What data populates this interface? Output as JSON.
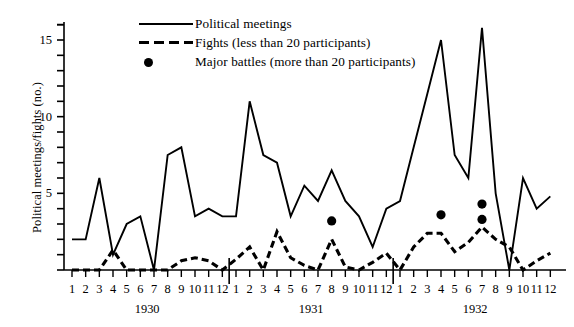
{
  "chart_data": {
    "type": "line",
    "title": "",
    "xlabel": "",
    "ylabel": "Political meetings/fights (no.)",
    "ylim": [
      0,
      16.6
    ],
    "yticks": [
      0,
      1,
      2,
      3,
      4,
      5,
      6,
      7,
      8,
      9,
      10,
      11,
      12,
      13,
      14,
      15,
      16
    ],
    "ytick_labels": [
      {
        "value": 5,
        "label": "5"
      },
      {
        "value": 10,
        "label": "10"
      },
      {
        "value": 15,
        "label": "15"
      }
    ],
    "grid": false,
    "legend_position": "top-center",
    "x_group_labels": [
      "1930",
      "1931",
      "1932"
    ],
    "categories": [
      "1930-1",
      "1930-2",
      "1930-3",
      "1930-4",
      "1930-5",
      "1930-6",
      "1930-7",
      "1930-8",
      "1930-9",
      "1930-10",
      "1930-11",
      "1930-12",
      "1931-1",
      "1931-2",
      "1931-3",
      "1931-4",
      "1931-5",
      "1931-6",
      "1931-7",
      "1931-8",
      "1931-9",
      "1931-10",
      "1931-11",
      "1931-12",
      "1932-1",
      "1932-2",
      "1932-3",
      "1932-4",
      "1932-5",
      "1932-6",
      "1932-7",
      "1932-8",
      "1932-9",
      "1932-10",
      "1932-11",
      "1932-12"
    ],
    "xtick_labels": [
      "1",
      "2",
      "3",
      "4",
      "5",
      "6",
      "7",
      "8",
      "9",
      "10",
      "11",
      "12",
      "1",
      "2",
      "3",
      "4",
      "5",
      "6",
      "7",
      "8",
      "9",
      "10",
      "11",
      "12",
      "1",
      "2",
      "3",
      "4",
      "5",
      "6",
      "7",
      "8",
      "9",
      "10",
      "11",
      "12"
    ],
    "series": [
      {
        "name": "Political meetings",
        "style": "solid",
        "color": "#000000",
        "values": [
          2,
          2,
          6,
          1,
          3,
          3.5,
          0,
          7.5,
          8,
          3.5,
          4,
          3.5,
          3.5,
          11,
          7.5,
          7,
          3.5,
          5.5,
          4.5,
          6.5,
          4.5,
          3.5,
          1.5,
          4,
          4.5,
          8,
          11.5,
          15,
          7.5,
          6,
          15.8,
          5,
          0,
          6,
          4,
          4.8
        ]
      },
      {
        "name": "Fights (less than 20 participants)",
        "style": "dashed",
        "color": "#000000",
        "values": [
          0,
          0,
          0,
          1.3,
          0,
          0,
          0,
          0,
          0.6,
          0.8,
          0.6,
          0,
          0.7,
          1.5,
          0,
          2.5,
          0.8,
          0.3,
          0,
          2,
          0.2,
          0,
          0.5,
          1.1,
          0,
          1.5,
          2.4,
          2.4,
          1.2,
          1.8,
          2.8,
          2,
          1.5,
          0,
          0.6,
          1.1
        ]
      }
    ],
    "markers": [
      {
        "name": "Major battles (more than 20 participants)",
        "x": "1931-8",
        "y": 3.2
      },
      {
        "name": "Major battles (more than 20 participants)",
        "x": "1932-4",
        "y": 3.6
      },
      {
        "name": "Major battles (more than 20 participants)",
        "x": "1932-7",
        "y": 4.3
      },
      {
        "name": "Major battles (more than 20 participants)",
        "x": "1932-7",
        "y": 3.3
      }
    ],
    "legend": [
      {
        "key": "solid-line",
        "label": "Political meetings"
      },
      {
        "key": "dashed-line",
        "label": "Fights (less than 20 participants)"
      },
      {
        "key": "filled-dot",
        "label": "Major battles (more than 20 participants)"
      }
    ]
  }
}
